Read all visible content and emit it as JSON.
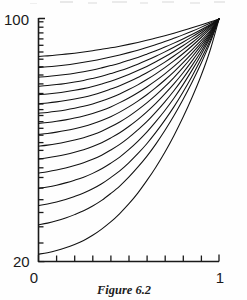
{
  "figure": {
    "caption": "Figure 6.2",
    "background_color": "#fefefe",
    "ink_color": "#111111"
  },
  "axes": {
    "x_label_left": "0",
    "x_label_right": "1",
    "y_label_top": "100",
    "y_label_bottom": "20"
  },
  "chart_data": {
    "type": "line",
    "title": "Figure 6.2",
    "xlabel": "",
    "ylabel": "",
    "xlim": [
      0,
      1
    ],
    "ylim": [
      20,
      100
    ],
    "yscale": "log",
    "xscale": "linear",
    "grid": false,
    "legend": null,
    "x_ticks": [
      0,
      0.1,
      0.2,
      0.3,
      0.4,
      0.5,
      0.6,
      0.7,
      0.8,
      0.9,
      1
    ],
    "x_tick_labels": [
      "0",
      "",
      "",
      "",
      "",
      "",
      "",
      "",
      "",
      "",
      "1"
    ],
    "y_ticks": [
      20,
      25,
      30,
      35,
      40,
      45,
      50,
      55,
      60,
      65,
      70,
      75,
      80,
      85,
      90,
      95,
      100
    ],
    "y_tick_labels": [
      "20",
      "",
      "",
      "",
      "",
      "",
      "",
      "",
      "",
      "",
      "",
      "",
      "",
      "",
      "",
      "",
      "100"
    ],
    "x": [
      0,
      0.05,
      0.1,
      0.15,
      0.2,
      0.25,
      0.3,
      0.35,
      0.4,
      0.45,
      0.5,
      0.55,
      0.6,
      0.65,
      0.7,
      0.75,
      0.8,
      0.85,
      0.9,
      0.95,
      1
    ],
    "convergence_point": [
      1,
      100
    ],
    "curve_count": 16,
    "series": [
      {
        "name": "curve-1",
        "y0": 78.0,
        "values": [
          78.0,
          78.3,
          78.7,
          79.2,
          79.7,
          80.3,
          81.0,
          81.8,
          82.6,
          83.5,
          84.5,
          85.6,
          86.8,
          88.1,
          89.5,
          91.0,
          92.6,
          94.3,
          96.1,
          98.0,
          100.0
        ]
      },
      {
        "name": "curve-2",
        "y0": 72.5,
        "values": [
          72.5,
          72.8,
          73.2,
          73.7,
          74.3,
          75.0,
          75.8,
          76.7,
          77.7,
          78.8,
          80.0,
          81.3,
          82.8,
          84.4,
          86.1,
          88.0,
          90.0,
          92.2,
          94.6,
          97.2,
          100.0
        ]
      },
      {
        "name": "curve-3",
        "y0": 68.0,
        "values": [
          68.0,
          68.3,
          68.7,
          69.2,
          69.8,
          70.5,
          71.3,
          72.3,
          73.4,
          74.6,
          76.0,
          77.5,
          79.2,
          81.0,
          83.0,
          85.2,
          87.6,
          90.2,
          93.1,
          96.3,
          100.0
        ]
      },
      {
        "name": "curve-4",
        "y0": 64.0,
        "values": [
          64.0,
          64.3,
          64.7,
          65.2,
          65.8,
          66.5,
          67.4,
          68.4,
          69.6,
          70.9,
          72.4,
          74.1,
          76.0,
          78.1,
          80.4,
          82.9,
          85.7,
          88.8,
          92.2,
          95.9,
          100.0
        ]
      },
      {
        "name": "curve-5",
        "y0": 60.5,
        "values": [
          60.5,
          60.8,
          61.2,
          61.7,
          62.3,
          63.0,
          63.9,
          65.0,
          66.2,
          67.6,
          69.2,
          71.0,
          73.0,
          75.3,
          77.8,
          80.6,
          83.7,
          87.2,
          91.0,
          95.3,
          100.0
        ]
      },
      {
        "name": "curve-6",
        "y0": 57.0,
        "values": [
          57.0,
          57.3,
          57.7,
          58.2,
          58.8,
          59.5,
          60.4,
          61.5,
          62.8,
          64.2,
          65.9,
          67.8,
          70.0,
          72.4,
          75.1,
          78.2,
          81.6,
          85.4,
          89.7,
          94.5,
          100.0
        ]
      },
      {
        "name": "curve-7",
        "y0": 53.5,
        "values": [
          53.5,
          53.8,
          54.2,
          54.7,
          55.3,
          56.0,
          56.9,
          58.0,
          59.3,
          60.8,
          62.6,
          64.6,
          66.9,
          69.5,
          72.4,
          75.7,
          79.4,
          83.6,
          88.3,
          93.7,
          100.0
        ]
      },
      {
        "name": "curve-8",
        "y0": 50.0,
        "values": [
          50.0,
          50.3,
          50.7,
          51.2,
          51.8,
          52.5,
          53.4,
          54.5,
          55.8,
          57.4,
          59.2,
          61.3,
          63.7,
          66.4,
          69.5,
          73.0,
          77.0,
          81.5,
          86.6,
          92.5,
          100.0
        ]
      },
      {
        "name": "curve-9",
        "y0": 46.5,
        "values": [
          46.5,
          46.8,
          47.2,
          47.7,
          48.3,
          49.0,
          49.9,
          51.0,
          52.3,
          53.9,
          55.8,
          58.0,
          60.5,
          63.4,
          66.7,
          70.4,
          74.7,
          79.6,
          85.2,
          91.7,
          100.0
        ]
      },
      {
        "name": "curve-10",
        "y0": 43.0,
        "values": [
          43.0,
          43.3,
          43.7,
          44.2,
          44.8,
          45.5,
          46.4,
          47.5,
          48.9,
          50.5,
          52.4,
          54.7,
          57.3,
          60.3,
          63.8,
          67.8,
          72.4,
          77.7,
          83.8,
          90.9,
          100.0
        ]
      },
      {
        "name": "curve-11",
        "y0": 39.5,
        "values": [
          39.5,
          39.8,
          40.2,
          40.7,
          41.3,
          42.0,
          42.9,
          44.0,
          45.4,
          47.0,
          49.0,
          51.3,
          54.0,
          57.1,
          60.8,
          65.0,
          69.9,
          75.6,
          82.2,
          90.0,
          100.0
        ]
      },
      {
        "name": "curve-12",
        "y0": 36.0,
        "values": [
          36.0,
          36.3,
          36.7,
          37.2,
          37.8,
          38.5,
          39.4,
          40.5,
          41.9,
          43.5,
          45.5,
          47.9,
          50.6,
          53.9,
          57.7,
          62.1,
          67.3,
          73.4,
          80.5,
          89.0,
          100.0
        ]
      },
      {
        "name": "curve-13",
        "y0": 32.5,
        "values": [
          32.5,
          32.8,
          33.2,
          33.7,
          34.3,
          35.0,
          35.9,
          37.0,
          38.4,
          40.0,
          42.0,
          44.4,
          47.2,
          50.6,
          54.5,
          59.1,
          64.6,
          71.1,
          78.8,
          88.1,
          100.0
        ]
      },
      {
        "name": "curve-14",
        "y0": 29.0,
        "values": [
          29.0,
          29.3,
          29.7,
          30.2,
          30.8,
          31.5,
          32.4,
          33.5,
          34.9,
          36.5,
          38.5,
          40.9,
          43.7,
          47.1,
          51.1,
          55.8,
          61.5,
          68.3,
          76.5,
          86.6,
          100.0
        ]
      },
      {
        "name": "curve-15",
        "y0": 25.5,
        "values": [
          25.5,
          25.8,
          26.2,
          26.7,
          27.3,
          28.0,
          28.9,
          30.0,
          31.4,
          33.0,
          35.0,
          37.4,
          40.2,
          43.6,
          47.7,
          52.6,
          58.5,
          65.6,
          74.3,
          85.2,
          100.0
        ]
      },
      {
        "name": "curve-16",
        "y0": 21.0,
        "values": [
          21.0,
          21.2,
          21.5,
          21.9,
          22.4,
          23.0,
          23.8,
          24.8,
          26.0,
          27.5,
          29.3,
          31.5,
          34.2,
          37.4,
          41.3,
          46.1,
          52.0,
          59.3,
          68.5,
          81.0,
          100.0
        ]
      }
    ]
  }
}
